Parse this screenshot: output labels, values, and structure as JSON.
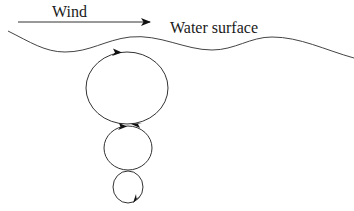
{
  "diagram": {
    "labels": {
      "wind": "Wind",
      "water_surface": "Water surface"
    },
    "elements": {
      "wind_arrow": {
        "direction": "right"
      },
      "water_surface_line": {
        "shape": "wavy"
      },
      "vortices": [
        {
          "size": "large",
          "rotation": "clockwise"
        },
        {
          "size": "medium",
          "rotation": "clockwise"
        },
        {
          "size": "small",
          "rotation": "clockwise"
        }
      ]
    },
    "colors": {
      "stroke": "#333333",
      "arrowhead": "#111111",
      "background": "#ffffff"
    }
  }
}
